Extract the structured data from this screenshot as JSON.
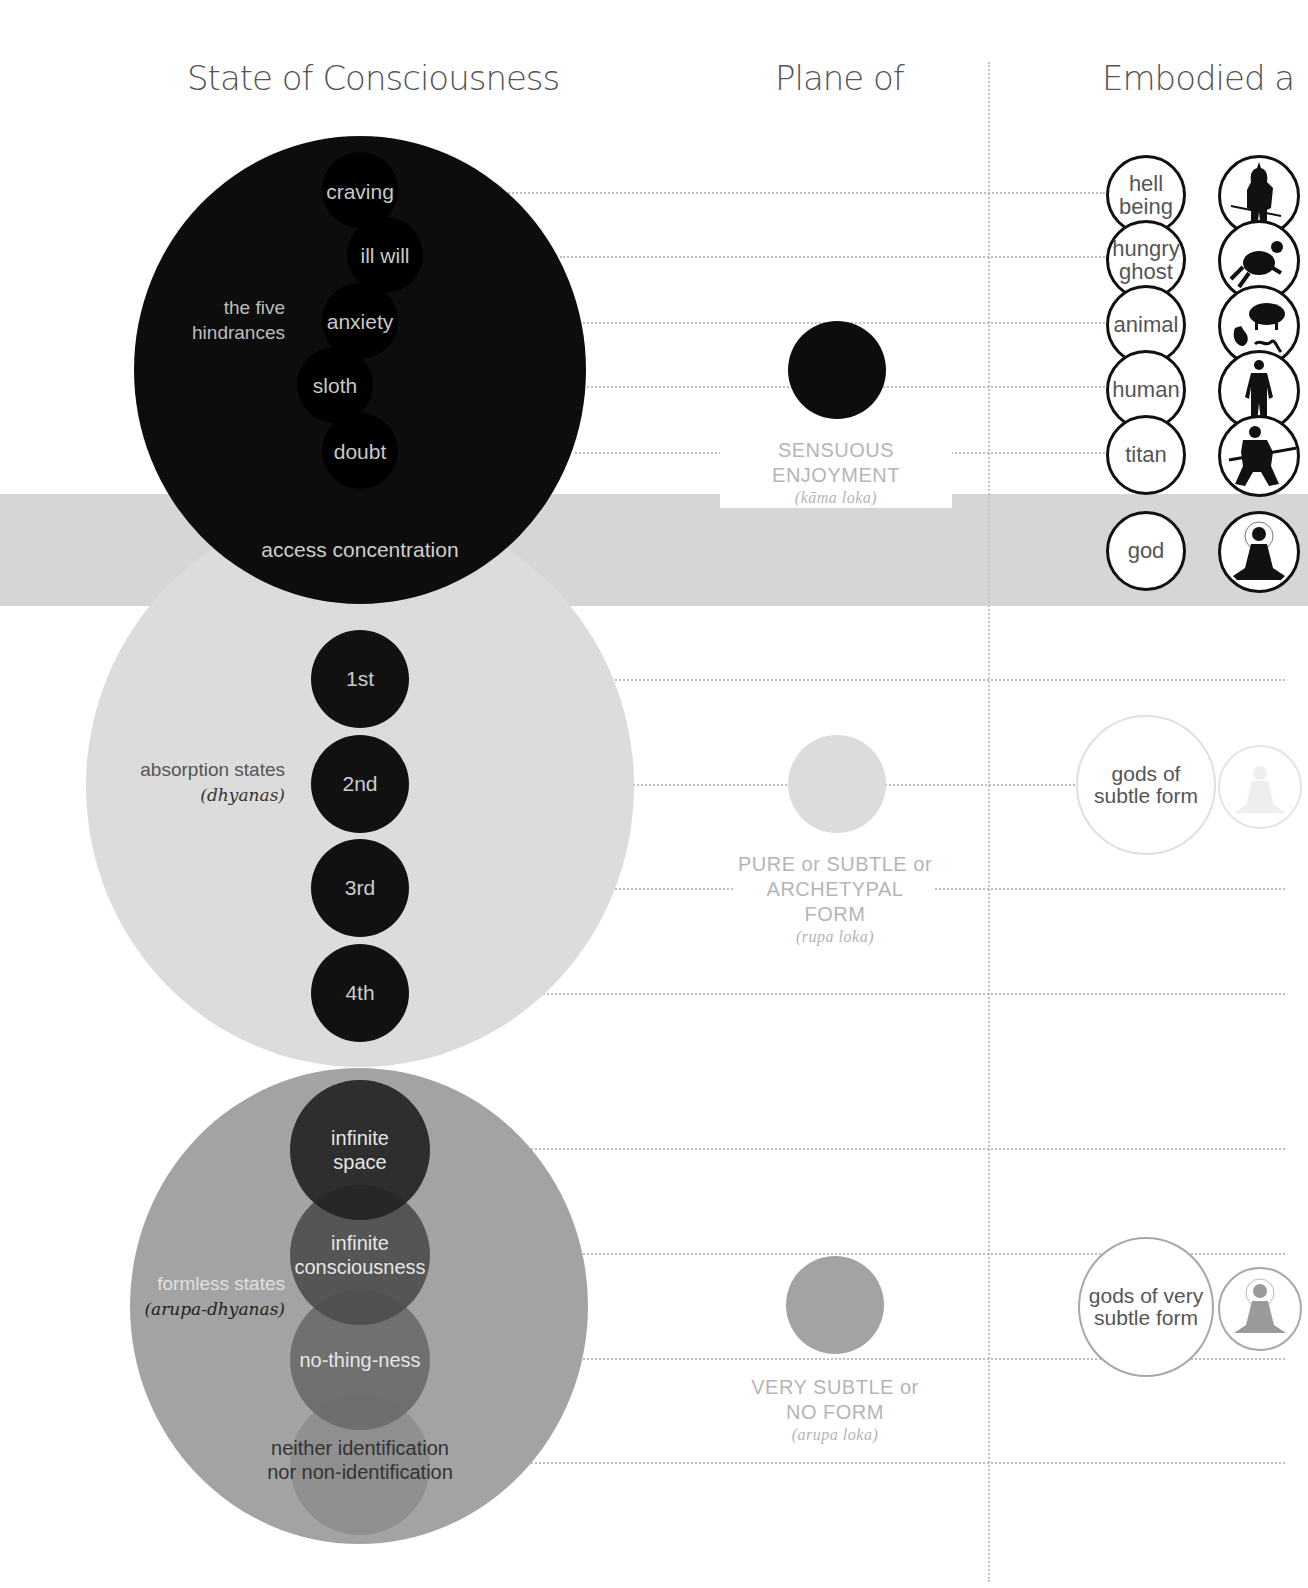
{
  "columns": {
    "state": "State of Consciousness",
    "plane": "Plane of",
    "embodied": "Embodied a"
  },
  "colors": {
    "hindrances": "#0d0d0d",
    "absorption": "#dcdcdc",
    "formless": "#a3a3a3",
    "band": "#d6d6d6",
    "plane_label": "#b5b5b5"
  },
  "hindrances": {
    "group_label_line1": "the five",
    "group_label_line2": "hindrances",
    "items": [
      "craving",
      "ill will",
      "anxiety",
      "sloth",
      "doubt"
    ]
  },
  "access": {
    "label": "access concentration"
  },
  "absorption": {
    "group_label": "absorption states",
    "group_sub": "(dhyanas)",
    "items": [
      "1st",
      "2nd",
      "3rd",
      "4th"
    ]
  },
  "formless": {
    "group_label": "formless states",
    "group_sub": "(arupa-dhyanas)",
    "items": [
      {
        "line1": "infinite",
        "line2": "space"
      },
      {
        "line1": "infinite",
        "line2": "consciousness"
      },
      {
        "line1": "no-thing-ness",
        "line2": ""
      },
      {
        "line1": "neither identification",
        "line2": "nor non-identification"
      }
    ]
  },
  "planes": [
    {
      "label_line1": "SENSUOUS ENJOYMENT",
      "label_line2": "",
      "sub": "(kāma loka)"
    },
    {
      "label_line1": "PURE or SUBTLE or",
      "label_line2": "ARCHETYPAL FORM",
      "sub": "(rupa loka)"
    },
    {
      "label_line1": "VERY SUBTLE or",
      "label_line2": "NO FORM",
      "sub": "(arupa loka)"
    }
  ],
  "realms": {
    "sensuous": [
      {
        "line1": "hell",
        "line2": "being",
        "icon": "demon-with-trident-icon"
      },
      {
        "line1": "hungry",
        "line2": "ghost",
        "icon": "hungry-ghost-icon"
      },
      {
        "line1": "animal",
        "line2": "",
        "icon": "animals-pig-rooster-snake-icon"
      },
      {
        "line1": "human",
        "line2": "",
        "icon": "human-figure-icon"
      },
      {
        "line1": "titan",
        "line2": "",
        "icon": "warrior-with-spear-icon"
      }
    ],
    "god": {
      "line1": "god",
      "icon": "meditating-buddha-icon"
    },
    "subtle": {
      "line1": "gods of",
      "line2": "subtle form",
      "icon": "faded-buddha-icon"
    },
    "very_subtle": {
      "line1": "gods of very",
      "line2": "subtle form",
      "icon": "grey-buddha-icon"
    }
  }
}
